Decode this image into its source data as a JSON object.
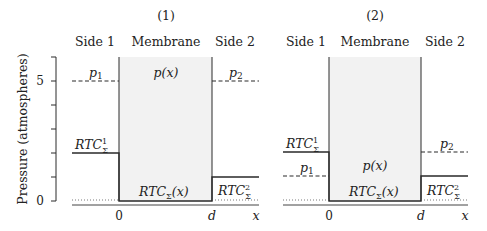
{
  "y_axis": {
    "label": "Pressure (atmospheres)",
    "ticks": [
      "0",
      "5"
    ],
    "range": [
      0,
      6
    ]
  },
  "panels": [
    {
      "title": "(1)",
      "headers": {
        "side1": "Side 1",
        "membrane": "Membrane",
        "side2": "Side 2"
      },
      "labels": {
        "p1": "p",
        "p1_sub": "1",
        "px": "p(x)",
        "p2": "p",
        "p2_sub": "2",
        "rtc1": "RTC",
        "rtc1_sup": "1",
        "rtc1_sub": "Σ",
        "rtcx": "RTC",
        "rtcx_sub": "Σ",
        "rtcx_arg": "(x)",
        "rtc2": "RTC",
        "rtc2_sup": "2",
        "rtc2_sub": "Σ"
      },
      "x_ticks": {
        "zero": "0",
        "d": "d",
        "x": "x"
      },
      "values": {
        "p1": 5,
        "p2": 5,
        "px": 5,
        "rtc1": 2,
        "rtc2": 1,
        "rtcx": 0
      }
    },
    {
      "title": "(2)",
      "headers": {
        "side1": "Side 1",
        "membrane": "Membrane",
        "side2": "Side 2"
      },
      "labels": {
        "p1": "p",
        "p1_sub": "1",
        "px": "p(x)",
        "p2": "p",
        "p2_sub": "2",
        "rtc1": "RTC",
        "rtc1_sup": "1",
        "rtc1_sub": "Σ",
        "rtcx": "RTC",
        "rtcx_sub": "Σ",
        "rtcx_arg": "(x)",
        "rtc2": "RTC",
        "rtc2_sup": "2",
        "rtc2_sub": "Σ"
      },
      "x_ticks": {
        "zero": "0",
        "d": "d",
        "x": "x"
      },
      "values": {
        "p1": 1,
        "p2": 2,
        "rtc1": 2,
        "rtc2": 1,
        "rtcx": 0
      }
    }
  ],
  "colors": {
    "membrane_fill": "#f2f2f2",
    "line": "#2a2a2a"
  }
}
